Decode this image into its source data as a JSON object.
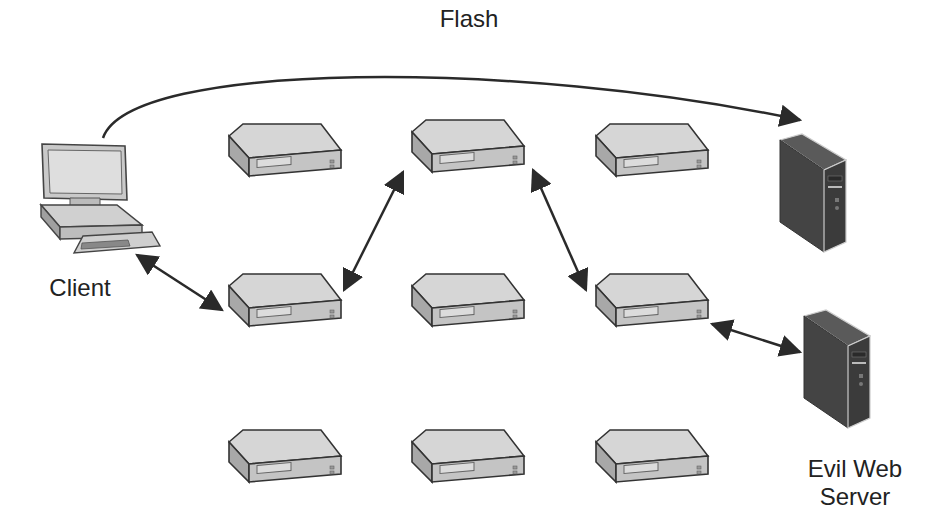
{
  "diagram": {
    "labels": {
      "flash": "Flash",
      "client": "Client",
      "evil_server_line1": "Evil Web",
      "evil_server_line2": "Server"
    },
    "nodes": [
      {
        "id": "client",
        "type": "desktop-computer",
        "label": "Client"
      },
      {
        "id": "flash-target",
        "type": "tower-server",
        "label": ""
      },
      {
        "id": "evil-web-server",
        "type": "tower-server",
        "label": "Evil Web Server"
      },
      {
        "id": "relay-r1c1",
        "type": "network-device"
      },
      {
        "id": "relay-r1c2",
        "type": "network-device"
      },
      {
        "id": "relay-r1c3",
        "type": "network-device"
      },
      {
        "id": "relay-r2c1",
        "type": "network-device"
      },
      {
        "id": "relay-r2c2",
        "type": "network-device"
      },
      {
        "id": "relay-r2c3",
        "type": "network-device"
      },
      {
        "id": "relay-r3c1",
        "type": "network-device"
      },
      {
        "id": "relay-r3c2",
        "type": "network-device"
      },
      {
        "id": "relay-r3c3",
        "type": "network-device"
      }
    ],
    "edges": [
      {
        "from": "client",
        "to": "flash-target",
        "label": "Flash",
        "style": "curved-one-way"
      },
      {
        "from": "client",
        "to": "relay-r2c1",
        "style": "bidirectional"
      },
      {
        "from": "relay-r2c1",
        "to": "relay-r1c2",
        "style": "bidirectional"
      },
      {
        "from": "relay-r1c2",
        "to": "relay-r2c3",
        "style": "bidirectional"
      },
      {
        "from": "relay-r2c3",
        "to": "evil-web-server",
        "style": "bidirectional"
      }
    ],
    "colors": {
      "line": "#2a2a2a",
      "device_top": "#d4d4d4",
      "device_side": "#a8a8a8",
      "tower_body": "#4a4a4a",
      "tower_front": "#3a3a3a",
      "text": "#222222"
    }
  }
}
